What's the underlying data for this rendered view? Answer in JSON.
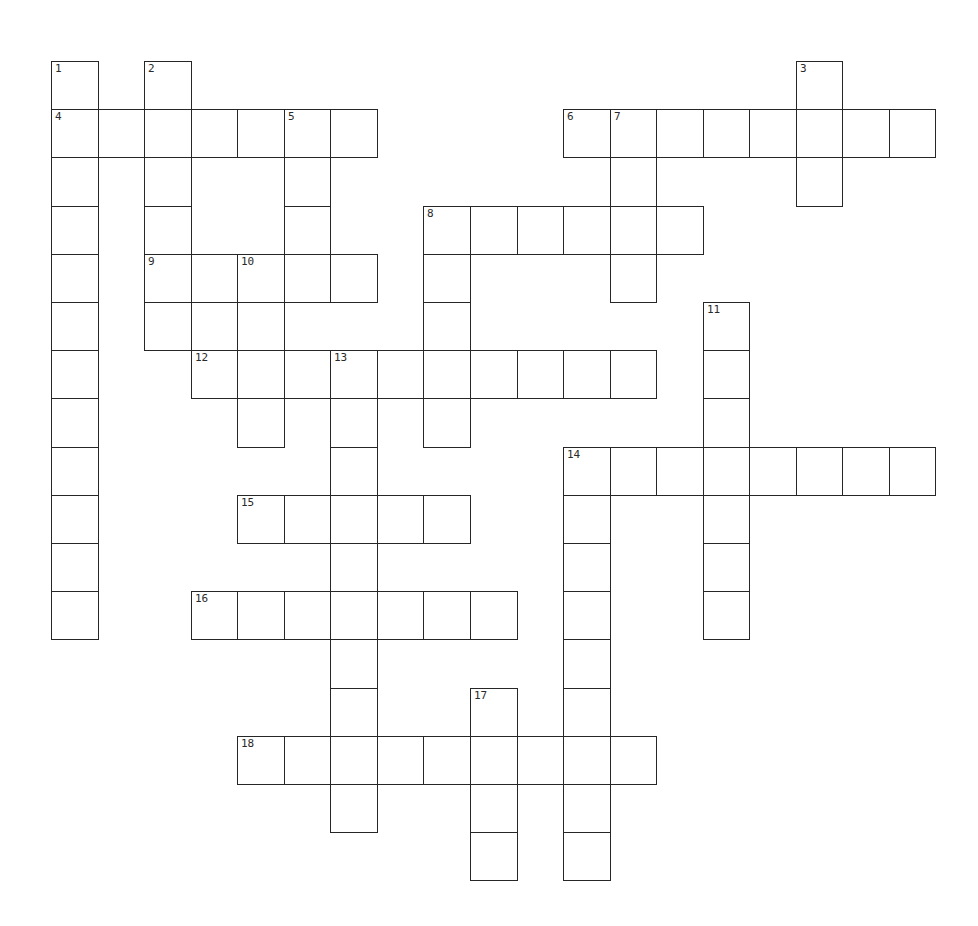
{
  "puzzle": {
    "grid": {
      "origin_x": 51,
      "origin_y": 61,
      "cell_w": 46.55,
      "cell_h": 48.2,
      "line_color": "#262626"
    },
    "entries": [
      {
        "number": "1",
        "direction": "down",
        "row": 0,
        "col": 0,
        "length": 12
      },
      {
        "number": "2",
        "direction": "down",
        "row": 0,
        "col": 2,
        "length": 6
      },
      {
        "number": "3",
        "direction": "down",
        "row": 0,
        "col": 16,
        "length": 3
      },
      {
        "number": "4",
        "direction": "across",
        "row": 1,
        "col": 0,
        "length": 7
      },
      {
        "number": "5",
        "direction": "down",
        "row": 1,
        "col": 5,
        "length": 4
      },
      {
        "number": "6",
        "direction": "across",
        "row": 1,
        "col": 11,
        "length": 8
      },
      {
        "number": "7",
        "direction": "down",
        "row": 1,
        "col": 12,
        "length": 4
      },
      {
        "number": "8",
        "direction": "across",
        "row": 3,
        "col": 8,
        "length": 6
      },
      {
        "number": "8",
        "direction": "down",
        "row": 3,
        "col": 8,
        "length": 5
      },
      {
        "number": "9",
        "direction": "across",
        "row": 4,
        "col": 2,
        "length": 5
      },
      {
        "number": "10",
        "direction": "down",
        "row": 4,
        "col": 4,
        "length": 4
      },
      {
        "number": "",
        "direction": "down",
        "row": 4,
        "col": 3,
        "length": 3
      },
      {
        "number": "11",
        "direction": "down",
        "row": 5,
        "col": 14,
        "length": 7
      },
      {
        "number": "12",
        "direction": "across",
        "row": 6,
        "col": 3,
        "length": 10
      },
      {
        "number": "13",
        "direction": "down",
        "row": 6,
        "col": 6,
        "length": 10
      },
      {
        "number": "14",
        "direction": "across",
        "row": 8,
        "col": 11,
        "length": 8
      },
      {
        "number": "14",
        "direction": "down",
        "row": 8,
        "col": 11,
        "length": 9
      },
      {
        "number": "15",
        "direction": "across",
        "row": 9,
        "col": 4,
        "length": 5
      },
      {
        "number": "16",
        "direction": "across",
        "row": 11,
        "col": 3,
        "length": 7
      },
      {
        "number": "17",
        "direction": "down",
        "row": 13,
        "col": 9,
        "length": 4
      },
      {
        "number": "18",
        "direction": "across",
        "row": 14,
        "col": 4,
        "length": 9
      }
    ],
    "labels": [
      {
        "number": "1",
        "row": 0,
        "col": 0
      },
      {
        "number": "2",
        "row": 0,
        "col": 2
      },
      {
        "number": "3",
        "row": 0,
        "col": 16
      },
      {
        "number": "4",
        "row": 1,
        "col": 0
      },
      {
        "number": "5",
        "row": 1,
        "col": 5
      },
      {
        "number": "6",
        "row": 1,
        "col": 11
      },
      {
        "number": "7",
        "row": 1,
        "col": 12
      },
      {
        "number": "8",
        "row": 3,
        "col": 8
      },
      {
        "number": "9",
        "row": 4,
        "col": 2
      },
      {
        "number": "10",
        "row": 4,
        "col": 4
      },
      {
        "number": "11",
        "row": 5,
        "col": 14
      },
      {
        "number": "12",
        "row": 6,
        "col": 3
      },
      {
        "number": "13",
        "row": 6,
        "col": 6
      },
      {
        "number": "14",
        "row": 8,
        "col": 11
      },
      {
        "number": "15",
        "row": 9,
        "col": 4
      },
      {
        "number": "16",
        "row": 11,
        "col": 3
      },
      {
        "number": "17",
        "row": 13,
        "col": 9
      },
      {
        "number": "18",
        "row": 14,
        "col": 4
      }
    ]
  }
}
